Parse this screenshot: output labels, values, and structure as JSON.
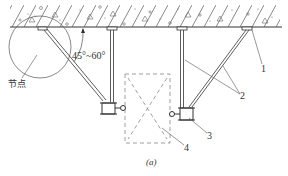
{
  "diagram": {
    "caption": "(a)",
    "angle_label": "45°~60°",
    "node_label": "节点",
    "callouts": [
      {
        "id": "1",
        "label": "1"
      },
      {
        "id": "2",
        "label": "2"
      },
      {
        "id": "3",
        "label": "3"
      },
      {
        "id": "4",
        "label": "4"
      }
    ],
    "colors": {
      "line": "#333333",
      "dashed": "#777777",
      "background": "#ffffff"
    }
  }
}
